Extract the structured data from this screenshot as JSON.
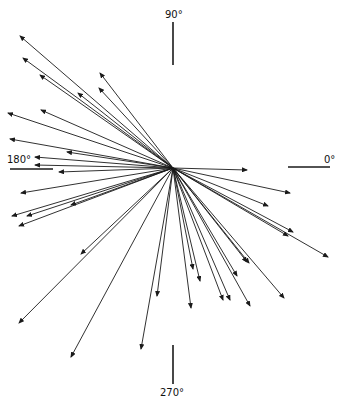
{
  "diagram": {
    "type": "vector-rose",
    "center": {
      "x": 173,
      "y": 168
    },
    "colors": {
      "line": "#1a1a1a",
      "background": "#ffffff"
    },
    "axes": [
      {
        "label": "90°",
        "direction": "north",
        "line": [
          173,
          22,
          173,
          65
        ],
        "label_pos": [
          165,
          10
        ]
      },
      {
        "label": "0°",
        "direction": "east",
        "line": [
          288,
          167,
          330,
          167
        ],
        "label_pos": [
          326,
          155
        ]
      },
      {
        "label": "180°",
        "direction": "west",
        "line": [
          10,
          169,
          53,
          169
        ],
        "label_pos": [
          7,
          155
        ]
      },
      {
        "label": "270°",
        "direction": "south",
        "line": [
          173,
          345,
          173,
          384
        ],
        "label_pos": [
          162,
          387
        ]
      }
    ],
    "vectors": [
      {
        "tip": [
          20,
          36
        ]
      },
      {
        "tip": [
          23,
          58
        ]
      },
      {
        "tip": [
          40,
          75
        ]
      },
      {
        "tip": [
          100,
          73
        ]
      },
      {
        "tip": [
          99,
          88
        ]
      },
      {
        "tip": [
          78,
          93
        ]
      },
      {
        "tip": [
          8,
          113
        ]
      },
      {
        "tip": [
          41,
          110
        ]
      },
      {
        "tip": [
          10,
          139
        ]
      },
      {
        "tip": [
          67,
          152
        ]
      },
      {
        "tip": [
          35,
          157
        ]
      },
      {
        "tip": [
          35,
          165
        ]
      },
      {
        "tip": [
          59,
          172
        ]
      },
      {
        "tip": [
          21,
          193
        ]
      },
      {
        "tip": [
          12,
          216
        ]
      },
      {
        "tip": [
          27,
          216
        ]
      },
      {
        "tip": [
          71,
          205
        ]
      },
      {
        "tip": [
          19,
          226
        ]
      },
      {
        "tip": [
          81,
          254
        ]
      },
      {
        "tip": [
          19,
          323
        ]
      },
      {
        "tip": [
          71,
          357
        ]
      },
      {
        "tip": [
          157,
          296
        ]
      },
      {
        "tip": [
          141,
          349
        ]
      },
      {
        "tip": [
          193,
          269
        ]
      },
      {
        "tip": [
          200,
          281
        ]
      },
      {
        "tip": [
          191,
          308
        ]
      },
      {
        "tip": [
          223,
          300
        ]
      },
      {
        "tip": [
          230,
          300
        ]
      },
      {
        "tip": [
          237,
          276
        ]
      },
      {
        "tip": [
          250,
          306
        ]
      },
      {
        "tip": [
          247,
          262
        ]
      },
      {
        "tip": [
          247,
          170
        ]
      },
      {
        "tip": [
          290,
          193
        ]
      },
      {
        "tip": [
          268,
          206
        ]
      },
      {
        "tip": [
          293,
          232
        ]
      },
      {
        "tip": [
          288,
          236
        ]
      },
      {
        "tip": [
          328,
          257
        ]
      },
      {
        "tip": [
          249,
          263
        ]
      },
      {
        "tip": [
          284,
          298
        ]
      }
    ]
  }
}
